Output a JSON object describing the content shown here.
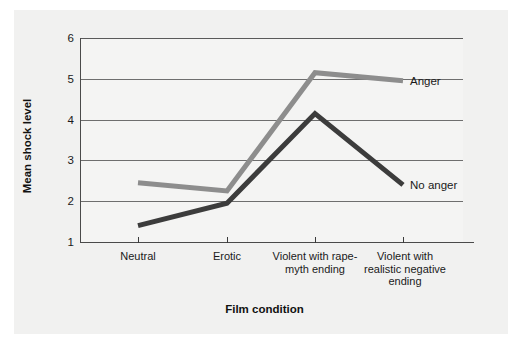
{
  "chart_data": {
    "type": "line",
    "title": "",
    "xlabel": "Film condition",
    "ylabel": "Mean shock level",
    "categories": [
      "Neutral",
      "Erotic",
      "Violent with rape-myth ending",
      "Violent with realistic negative ending"
    ],
    "ylim": [
      1,
      6
    ],
    "yticks": [
      1,
      2,
      3,
      4,
      5,
      6
    ],
    "ytick_labels": [
      "1",
      "2",
      "3",
      "4",
      "5",
      "6"
    ],
    "grid": true,
    "legend_position": "inline-right-annotation",
    "series": [
      {
        "name": "Anger",
        "color": "#8d8d8d",
        "values": [
          2.45,
          2.25,
          5.15,
          4.95
        ]
      },
      {
        "name": "No anger",
        "color": "#3c3c3c",
        "values": [
          1.4,
          1.95,
          4.15,
          2.4
        ]
      }
    ],
    "annotations": [
      {
        "text": "Anger",
        "series": "Anger"
      },
      {
        "text": "No anger",
        "series": "No anger"
      }
    ]
  },
  "axes": {
    "y_title": "Mean shock level",
    "x_title": "Film condition",
    "y_tick_labels": [
      "6",
      "5",
      "4",
      "3",
      "2",
      "1"
    ],
    "x_tick_labels": [
      "Neutral",
      "Erotic",
      "Violent with rape-\nmyth ending",
      "Violent with\nrealistic negative\nending"
    ]
  },
  "colors": {
    "background": "#f1f1f0",
    "plot_background": "#f4f4f3",
    "gridline": "#6e6e6e",
    "axis": "#4a4a4a",
    "series_anger": "#8d8d8d",
    "series_no_anger": "#3c3c3c",
    "text": "#1a1a1a"
  }
}
